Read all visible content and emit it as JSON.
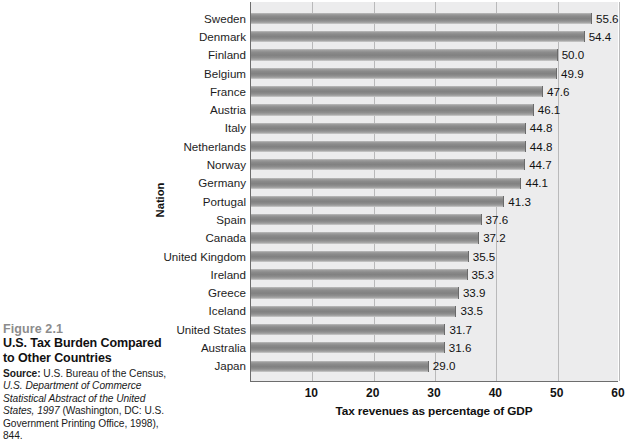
{
  "caption": {
    "figure_number": "Figure 2.1",
    "title_line1": "U.S. Tax Burden Compared",
    "title_line2": "to Other Countries",
    "source_label": "Source:",
    "source_line1": " U.S. Bureau of the Census,",
    "source_line2": "U.S. Department of Commerce",
    "source_line3": "Statistical Abstract of the United",
    "source_line4_italic": "States, 1997",
    "source_line4_rest": " (Washington, DC: U.S.",
    "source_line5": "Government Printing Office, 1998), 844."
  },
  "chart_data": {
    "type": "bar",
    "orientation": "horizontal",
    "title": "",
    "xlabel": "Tax revenues as percentage of GDP",
    "ylabel": "Nation",
    "xlim": [
      0,
      60
    ],
    "xticks": [
      10,
      20,
      30,
      40,
      50,
      60
    ],
    "grid": true,
    "legend": "none",
    "bar_color": "#8a8a8a",
    "plot_background": "#ececed",
    "categories": [
      "Sweden",
      "Denmark",
      "Finland",
      "Belgium",
      "France",
      "Austria",
      "Italy",
      "Netherlands",
      "Norway",
      "Germany",
      "Portugal",
      "Spain",
      "Canada",
      "United Kingdom",
      "Ireland",
      "Greece",
      "Iceland",
      "United States",
      "Australia",
      "Japan"
    ],
    "values": [
      55.6,
      54.4,
      50.0,
      49.9,
      47.6,
      46.1,
      44.8,
      44.8,
      44.7,
      44.1,
      41.3,
      37.6,
      37.2,
      35.5,
      35.3,
      33.9,
      33.5,
      31.7,
      31.6,
      29.0
    ],
    "value_labels": [
      "55.6",
      "54.4",
      "50.0",
      "49.9",
      "47.6",
      "46.1",
      "44.8",
      "44.8",
      "44.7",
      "44.1",
      "41.3",
      "37.6",
      "37.2",
      "35.5",
      "35.3",
      "33.9",
      "33.5",
      "31.7",
      "31.6",
      "29.0"
    ]
  }
}
